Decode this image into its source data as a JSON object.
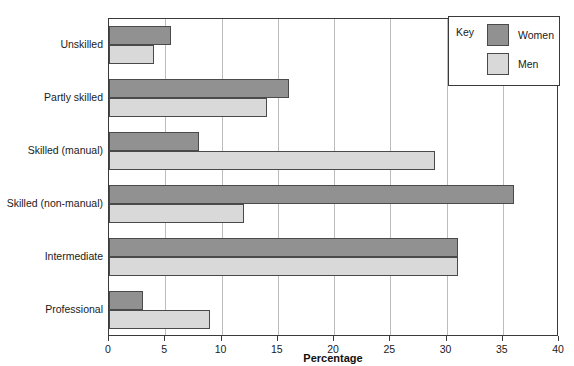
{
  "chart_data": {
    "type": "bar",
    "orientation": "horizontal",
    "title": "",
    "xlabel": "Percentage",
    "ylabel": "",
    "xlim": [
      0,
      40
    ],
    "xticks": [
      0,
      5,
      10,
      15,
      20,
      25,
      30,
      35,
      40
    ],
    "grid": true,
    "categories": [
      "Unskilled",
      "Partly skilled",
      "Skilled (manual)",
      "Skilled (non-manual)",
      "Intermediate",
      "Professional"
    ],
    "series": [
      {
        "name": "Women",
        "color": "#919191",
        "values": [
          5.5,
          16,
          8,
          36,
          31,
          3
        ]
      },
      {
        "name": "Men",
        "color": "#d9d9d9",
        "values": [
          4,
          14,
          29,
          12,
          31,
          9
        ]
      }
    ],
    "legend": {
      "title": "Key",
      "position": "top-right",
      "entries": [
        {
          "label": "Women",
          "color": "#919191"
        },
        {
          "label": "Men",
          "color": "#d9d9d9"
        }
      ]
    }
  }
}
